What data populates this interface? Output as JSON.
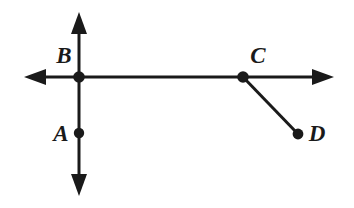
{
  "diagram": {
    "background_color": "#ffffff",
    "ink_color": "#1a1a1a",
    "canvas": {
      "width": 354,
      "height": 208
    },
    "labels": [
      {
        "id": "B",
        "text": "B",
        "x": 64,
        "y": 63
      },
      {
        "id": "A",
        "text": "A",
        "x": 61,
        "y": 141
      },
      {
        "id": "C",
        "text": "C",
        "x": 258,
        "y": 63
      },
      {
        "id": "D",
        "text": "D",
        "x": 317,
        "y": 141
      }
    ],
    "points": [
      {
        "id": "B",
        "label": "B",
        "x": 79,
        "y": 77,
        "radius": 5.5
      },
      {
        "id": "A",
        "label": "A",
        "x": 79,
        "y": 133,
        "radius": 5.0
      },
      {
        "id": "C",
        "label": "C",
        "x": 243,
        "y": 77,
        "radius": 5.5
      },
      {
        "id": "D",
        "label": "D",
        "x": 298,
        "y": 134,
        "radius": 5.0
      }
    ],
    "lines": [
      {
        "id": "horizontal-line",
        "name": "horizontal double-headed line through B and C",
        "x1": 30,
        "y1": 77,
        "x2": 328,
        "y2": 77,
        "arrow_start": true,
        "arrow_end": true
      },
      {
        "id": "vertical-line",
        "name": "vertical double-headed line through B and A",
        "x1": 79,
        "y1": 18,
        "x2": 79,
        "y2": 190,
        "arrow_start": true,
        "arrow_end": true
      },
      {
        "id": "segment-cd",
        "name": "segment from C to D",
        "x1": 243,
        "y1": 77,
        "x2": 298,
        "y2": 134,
        "arrow_start": false,
        "arrow_end": false
      }
    ],
    "arrow_heads": [
      {
        "id": "left-arrow",
        "tip_x": 24,
        "tip_y": 77,
        "direction": "left"
      },
      {
        "id": "right-arrow",
        "tip_x": 334,
        "tip_y": 77,
        "direction": "right"
      },
      {
        "id": "top-arrow",
        "tip_x": 79,
        "tip_y": 12,
        "direction": "up"
      },
      {
        "id": "bottom-arrow",
        "tip_x": 79,
        "tip_y": 196,
        "direction": "down"
      }
    ]
  }
}
